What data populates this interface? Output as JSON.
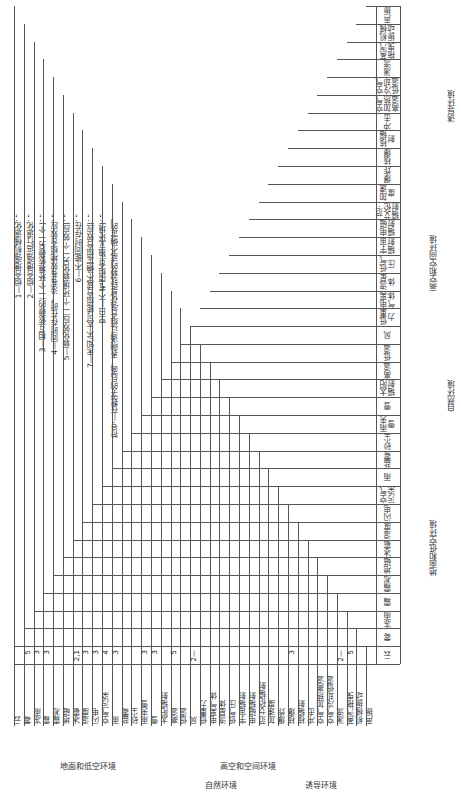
{
  "legend": [
    "1—组合增强机械退化；",
    "2—组合增强运行退化；",
    "3—相互依赖的(一个环境依赖另一个)；",
    "4—同时存在时，没有有效地组合效应；",
    "5—弱化效应(一个环境弱化另一个效应)；",
    "6—不能同时存在；",
    "7—未知/不太可能组合或不确定组合效应)；",
    "空白—不考虑组合(独立环境)；",
    "符号—在数字的后面，表明通过组合强化是较弱的或不确定的。"
  ],
  "environments": [
    "云",
    "雾",
    "冻雨",
    "霜",
    "霜凇",
    "地磁",
    "冰雹",
    "湿度",
    "闪电",
    "空气污染",
    "雨",
    "盐雾",
    "砂尘",
    "雨夹雪",
    "雪",
    "太阳辐射",
    "高温",
    "低温",
    "风",
    "低重力",
    "电离气体",
    "流星体",
    "低气压",
    "宇宙辐射",
    "电磁辐射",
    "范·艾伦辐射",
    "加速度",
    "爆炸",
    "核爆",
    "核辐射",
    "冲击",
    "空气加热高温",
    "空气冷却低温",
    "湍流",
    "蒸汽拖曳",
    "机械振动",
    "声振"
  ],
  "groups": {
    "ground": "地面和低空环境",
    "high": "高空和空间环境",
    "natural": "自然环境",
    "induced": "诱导环境"
  },
  "matrix_sample": [
    {
      "row": "雾",
      "col": "云",
      "value": "5"
    },
    {
      "row": "冻雨",
      "col": "云",
      "value": "3"
    },
    {
      "row": "霜",
      "col": "云",
      "value": "3"
    },
    {
      "row": "冰雹",
      "col": "云",
      "value": "2,1"
    },
    {
      "row": "湿度",
      "col": "云",
      "value": "3"
    },
    {
      "row": "闪电",
      "col": "云",
      "value": "3"
    },
    {
      "row": "空气污染",
      "col": "云",
      "value": "4"
    },
    {
      "row": "雨",
      "col": "云",
      "value": "3"
    },
    {
      "row": "雨夹雪",
      "col": "云",
      "value": "3"
    },
    {
      "row": "雪",
      "col": "云",
      "value": "3"
    },
    {
      "row": "高温",
      "col": "云",
      "value": "5"
    },
    {
      "row": "风",
      "col": "云",
      "value": "2—"
    },
    {
      "row": "核爆",
      "col": "云",
      "value": "3"
    },
    {
      "row": "湍流",
      "col": "云",
      "value": "2—"
    },
    {
      "row": "蒸汽拖曳",
      "col": "云",
      "value": "5"
    }
  ]
}
